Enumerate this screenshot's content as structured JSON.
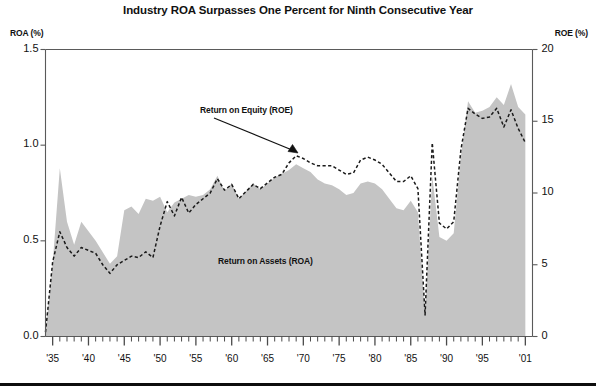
{
  "chart_data": {
    "type": "area",
    "title": "Industry ROA Surpasses One Percent for Ninth Consecutive Year",
    "xlabel": "",
    "ylabel": "ROA (%)",
    "y2label": "ROE (%)",
    "ylim": [
      0.0,
      1.5
    ],
    "y2lim": [
      0,
      20
    ],
    "xlim": [
      1934,
      2002
    ],
    "grid": false,
    "legend_position": "inline-annotations",
    "fill_color": "#c4c4c4",
    "line_color": "#1a1a1a",
    "y_ticks": [
      "0.0",
      "0.5",
      "1.0",
      "1.5"
    ],
    "y_tick_values": [
      0.0,
      0.5,
      1.0,
      1.5
    ],
    "y2_ticks": [
      "0",
      "5",
      "10",
      "15",
      "20"
    ],
    "y2_tick_values": [
      0,
      5,
      10,
      15,
      20
    ],
    "x_ticks": [
      "'35",
      "'40",
      "'45",
      "'50",
      "'55",
      "'60",
      "'65",
      "'70",
      "'75",
      "'80",
      "'85",
      "'90",
      "'95",
      "'01"
    ],
    "x_tick_values": [
      1935,
      1940,
      1945,
      1950,
      1955,
      1960,
      1965,
      1970,
      1975,
      1980,
      1985,
      1990,
      1995,
      2001
    ],
    "annotations": [
      {
        "text": "Return on Equity (ROE)",
        "x": 1962,
        "y": 1.17
      },
      {
        "text": "Return on Assets (ROA)",
        "x": 1968,
        "y": 0.3
      }
    ],
    "x": [
      1934,
      1935,
      1936,
      1937,
      1938,
      1939,
      1940,
      1941,
      1942,
      1943,
      1944,
      1945,
      1946,
      1947,
      1948,
      1949,
      1950,
      1951,
      1952,
      1953,
      1954,
      1955,
      1956,
      1957,
      1958,
      1959,
      1960,
      1961,
      1962,
      1963,
      1964,
      1965,
      1966,
      1967,
      1968,
      1969,
      1970,
      1971,
      1972,
      1973,
      1974,
      1975,
      1976,
      1977,
      1978,
      1979,
      1980,
      1981,
      1982,
      1983,
      1984,
      1985,
      1986,
      1987,
      1988,
      1989,
      1990,
      1991,
      1992,
      1993,
      1994,
      1995,
      1996,
      1997,
      1998,
      1999,
      2000,
      2001
    ],
    "series": [
      {
        "name": "Return on Assets (ROA)",
        "style": "filled-area",
        "axis": "left",
        "unit": "%",
        "values": [
          0.02,
          0.38,
          0.88,
          0.6,
          0.48,
          0.6,
          0.55,
          0.5,
          0.44,
          0.38,
          0.42,
          0.66,
          0.68,
          0.64,
          0.72,
          0.71,
          0.73,
          0.65,
          0.7,
          0.72,
          0.74,
          0.73,
          0.74,
          0.77,
          0.84,
          0.76,
          0.8,
          0.72,
          0.76,
          0.8,
          0.77,
          0.8,
          0.83,
          0.85,
          0.87,
          0.9,
          0.88,
          0.86,
          0.82,
          0.8,
          0.79,
          0.77,
          0.74,
          0.75,
          0.8,
          0.81,
          0.8,
          0.77,
          0.72,
          0.67,
          0.66,
          0.71,
          0.65,
          0.11,
          0.84,
          0.52,
          0.5,
          0.54,
          0.94,
          1.23,
          1.17,
          1.18,
          1.2,
          1.25,
          1.21,
          1.32,
          1.2,
          1.16
        ]
      },
      {
        "name": "Return on Equity (ROE)",
        "style": "dashed-line",
        "axis": "right",
        "unit": "%",
        "values": [
          0.3,
          5.2,
          7.3,
          6.2,
          5.6,
          6.2,
          6.0,
          5.8,
          5.0,
          4.4,
          5.0,
          5.3,
          5.6,
          5.5,
          5.9,
          5.5,
          7.7,
          9.4,
          8.4,
          9.7,
          8.6,
          9.2,
          9.6,
          10.0,
          11.0,
          10.2,
          10.6,
          9.6,
          10.1,
          10.6,
          10.3,
          10.7,
          11.1,
          11.3,
          12.1,
          12.6,
          12.4,
          12.1,
          11.9,
          11.9,
          11.9,
          11.6,
          11.3,
          11.4,
          12.3,
          12.5,
          12.3,
          12.0,
          11.4,
          10.8,
          10.8,
          11.2,
          10.3,
          1.5,
          13.5,
          7.9,
          7.5,
          8.0,
          13.0,
          15.9,
          15.5,
          15.2,
          15.3,
          15.9,
          14.6,
          15.8,
          14.5,
          13.5
        ]
      }
    ]
  }
}
